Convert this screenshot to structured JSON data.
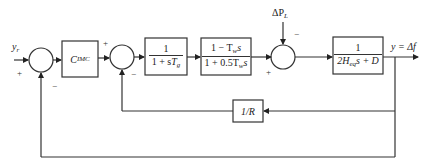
{
  "diagram": {
    "type": "control-block-diagram",
    "input_label": "y",
    "input_sub": "r",
    "output_label": "y = Δf",
    "disturbance_label": "ΔP",
    "disturbance_sub": "L",
    "blocks": {
      "controller": {
        "main": "C",
        "sub": "IMC"
      },
      "governor": {
        "num": "1",
        "den_pre": "1 + s",
        "den_var": "T",
        "den_sub": "g"
      },
      "turbine": {
        "num": "1 − T",
        "num_sub": "w",
        "num_post": "s",
        "den": "1 + 0.5T",
        "den_sub": "w",
        "den_post": "s"
      },
      "power_system": {
        "num": "1",
        "den_pre": "2H",
        "den_sub": "eq",
        "den_post": "s + D"
      },
      "droop": {
        "label": "1/R"
      }
    },
    "signs": {
      "sum1_input": "+",
      "sum1_feedback": "−",
      "sum2_input": "+",
      "sum2_feedback": "−",
      "sum3_input": "+",
      "sum3_disturbance": "−"
    },
    "colors": {
      "line": "#333333",
      "background": "#ffffff"
    }
  }
}
